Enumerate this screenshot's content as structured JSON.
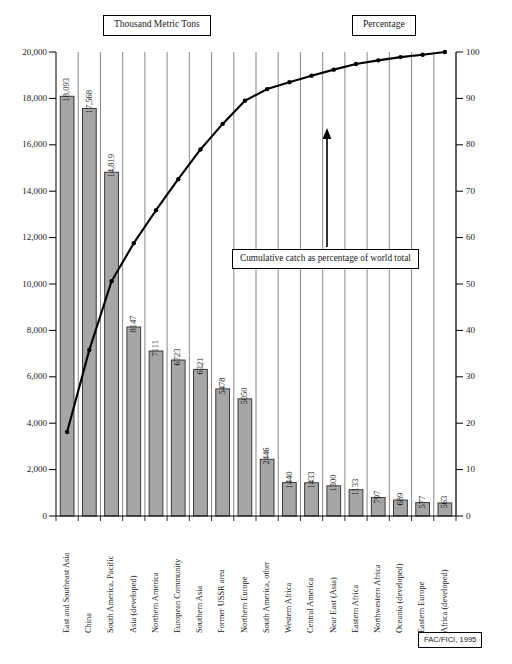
{
  "header": {
    "left_title": "Thousand Metric Tons",
    "right_title": "Percentage"
  },
  "annotation": {
    "text": "Cumulative catch as percentage of world total",
    "arrow": "up-arrow"
  },
  "source": {
    "label": "FAC/FICI, 1995"
  },
  "axes": {
    "left_ticks": [
      "0",
      "2,000",
      "4,000",
      "6,000",
      "8,000",
      "10,000",
      "12,000",
      "14,000",
      "16,000",
      "18,000",
      "20,000"
    ],
    "right_ticks": [
      "0",
      "10",
      "20",
      "30",
      "40",
      "50",
      "60",
      "70",
      "80",
      "90",
      "100"
    ]
  },
  "colors": {
    "bar_fill": "#a6a6a6",
    "bar_stroke": "#2b2b2b",
    "line": "#000000",
    "gridline": "#555555",
    "axis": "#000000",
    "background": "#ffffff"
  },
  "chart_data": {
    "type": "bar",
    "title": "Thousand Metric Tons",
    "subtitle": "Percentage",
    "xlabel": "",
    "ylabel": "Thousand Metric Tons",
    "y2label": "Percentage",
    "ylim": [
      0,
      20000
    ],
    "y2lim": [
      0,
      100
    ],
    "grid": true,
    "legend": "none",
    "categories": [
      "East and Southeast Asia",
      "China",
      "South America, Pacific",
      "Asia (developed)",
      "Northern America",
      "European Community",
      "Southern Asia",
      "Former USSR area",
      "Northern Europe",
      "South America, other",
      "Western Africa",
      "Central America",
      "Near East (Asia)",
      "Eastern Africa",
      "Northwestern Africa",
      "Oceania (developed)",
      "Eastern Europe",
      "Africa (developed)"
    ],
    "values": [
      18093,
      17568,
      14819,
      8147,
      7111,
      6723,
      6321,
      5478,
      5050,
      2446,
      1440,
      1433,
      1300,
      1133,
      797,
      689,
      577,
      563
    ],
    "value_labels": [
      "18,093",
      "17,568",
      "14,819",
      "8147",
      "7111",
      "6723",
      "6321",
      "5478",
      "5050",
      "2446",
      "1440",
      "1433",
      "1300",
      "1133",
      "797",
      "689",
      "577",
      "563"
    ],
    "series": [
      {
        "name": "Cumulative catch as percentage of world total",
        "type": "line",
        "axis": "right",
        "values": [
          18.1,
          35.8,
          50.6,
          58.8,
          65.9,
          72.6,
          79.0,
          84.5,
          89.5,
          92.0,
          93.5,
          94.9,
          96.2,
          97.4,
          98.2,
          98.9,
          99.4,
          100.0
        ]
      }
    ]
  }
}
